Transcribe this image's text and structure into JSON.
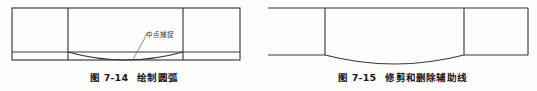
{
  "page": {
    "background_color": "#fdfdfc",
    "line_color": "#3a3a3a",
    "text_color": "#16161a"
  },
  "figures": [
    {
      "id": "figure-7-14",
      "caption_number": "图 7-14",
      "caption_text": "绘制圆弧",
      "annotation": {
        "label": "中点捕捉",
        "leader_from": [
          133,
          59
        ],
        "leader_to": [
          147,
          33
        ]
      },
      "drawing": {
        "type": "line-drawing",
        "outer_rect": {
          "x": 12,
          "y": 8,
          "width": 228,
          "height": 52
        },
        "vertical_dividers_x": [
          68,
          183
        ],
        "horizontal_line_y": 52,
        "arc": {
          "start": [
            68,
            52
          ],
          "end": [
            183,
            52
          ],
          "sag_depth": 8,
          "direction": "downward"
        }
      }
    },
    {
      "id": "figure-7-15",
      "caption_number": "图 7-15",
      "caption_text": "修剪和删除辅助线",
      "annotation": null,
      "drawing": {
        "type": "line-drawing",
        "outer_rect": {
          "x": 256,
          "y": 8,
          "width": 272,
          "height": 47
        },
        "vertical_dividers_x": [
          325,
          464
        ],
        "side_panel_bottom_y": 55,
        "arc": {
          "start": [
            325,
            55
          ],
          "end": [
            464,
            55
          ],
          "sag_depth": 9,
          "direction": "downward"
        }
      }
    }
  ]
}
